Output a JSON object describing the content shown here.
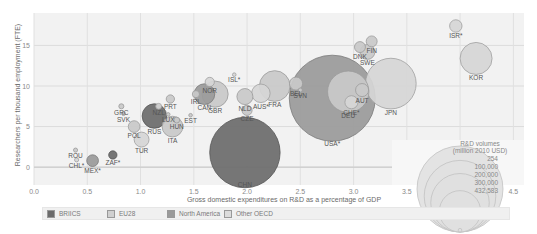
{
  "chart_data": {
    "type": "scatter",
    "subtype": "bubble",
    "title": "",
    "xlabel": "Gross domestic expenditures on  R&D as a percentage of GDP",
    "ylabel": "Researchers per thousand employment (FTE)",
    "xlim": [
      0.0,
      4.6
    ],
    "ylim": [
      -2.2,
      19.0
    ],
    "xticks": [
      "0.0",
      "0.5",
      "1.0",
      "1.5",
      "2.0",
      "2.5",
      "3.0",
      "3.5",
      "4.0",
      "4.5"
    ],
    "yticks": [
      "0",
      "5",
      "10",
      "15"
    ],
    "grid": true,
    "colors": {
      "BRIICS": "#6b6b6b",
      "EU28": "#c9c9c9",
      "North America": "#9a9a9a",
      "Other OECD": "#d6d6d6"
    },
    "legend": [
      "BRIICS",
      "EU28",
      "North America",
      "Other OECD"
    ],
    "size_legend": {
      "title_line1": "R&D volumes",
      "title_line2": "(million 2010 USD)",
      "values": [
        "254",
        "100,000",
        "200,000",
        "300,000",
        "432,583"
      ]
    },
    "points": [
      {
        "label": "ISR*",
        "x": 3.96,
        "y": 17.4,
        "group": "Other OECD",
        "size": 9000
      },
      {
        "label": "KOR",
        "x": 4.15,
        "y": 13.4,
        "group": "Other OECD",
        "size": 60000
      },
      {
        "label": "JPN",
        "x": 3.35,
        "y": 10.3,
        "group": "Other OECD",
        "size": 150000
      },
      {
        "label": "FIN",
        "x": 3.17,
        "y": 15.5,
        "group": "EU28",
        "size": 7000
      },
      {
        "label": "DNK",
        "x": 3.06,
        "y": 14.8,
        "group": "EU28",
        "size": 7000
      },
      {
        "label": "SWE",
        "x": 3.13,
        "y": 14.2,
        "group": "EU28",
        "size": 13000
      },
      {
        "label": "AUT",
        "x": 3.08,
        "y": 9.5,
        "group": "EU28",
        "size": 10000
      },
      {
        "label": "DEU",
        "x": 2.95,
        "y": 9.3,
        "group": "EU28",
        "size": 100000
      },
      {
        "label": "CHE*",
        "x": 2.98,
        "y": 8.0,
        "group": "Other OECD",
        "size": 10000
      },
      {
        "label": "USA*",
        "x": 2.8,
        "y": 8.5,
        "group": "North America",
        "size": 432583
      },
      {
        "label": "BEL",
        "x": 2.46,
        "y": 10.3,
        "group": "EU28",
        "size": 10000
      },
      {
        "label": "SVN",
        "x": 2.5,
        "y": 9.5,
        "group": "EU28",
        "size": 1000
      },
      {
        "label": "FRA",
        "x": 2.26,
        "y": 10.0,
        "group": "EU28",
        "size": 55000
      },
      {
        "label": "AUS*",
        "x": 2.13,
        "y": 9.1,
        "group": "Other OECD",
        "size": 20000
      },
      {
        "label": "NLD",
        "x": 1.98,
        "y": 8.7,
        "group": "EU28",
        "size": 15000
      },
      {
        "label": "CZE",
        "x": 2.0,
        "y": 7.0,
        "group": "EU28",
        "size": 6000
      },
      {
        "label": "ISL*",
        "x": 1.88,
        "y": 11.4,
        "group": "Other OECD",
        "size": 300
      },
      {
        "label": "NOR",
        "x": 1.65,
        "y": 10.5,
        "group": "Other OECD",
        "size": 5000
      },
      {
        "label": "CAN",
        "x": 1.6,
        "y": 9.0,
        "group": "North America",
        "size": 25000
      },
      {
        "label": "GBR",
        "x": 1.7,
        "y": 9.0,
        "group": "EU28",
        "size": 40000
      },
      {
        "label": "IRL",
        "x": 1.52,
        "y": 9.0,
        "group": "EU28",
        "size": 3000
      },
      {
        "label": "EST",
        "x": 1.47,
        "y": 6.4,
        "group": "EU28",
        "size": 500
      },
      {
        "label": "PRT",
        "x": 1.28,
        "y": 8.4,
        "group": "EU28",
        "size": 4000
      },
      {
        "label": "NZL",
        "x": 1.17,
        "y": 7.5,
        "group": "Other OECD",
        "size": 2000
      },
      {
        "label": "LUX",
        "x": 1.26,
        "y": 6.5,
        "group": "EU28",
        "size": 700
      },
      {
        "label": "HUN",
        "x": 1.34,
        "y": 5.8,
        "group": "EU28",
        "size": 2000
      },
      {
        "label": "RUS",
        "x": 1.13,
        "y": 6.3,
        "group": "BRIICS",
        "size": 35000
      },
      {
        "label": "ITA",
        "x": 1.3,
        "y": 5.0,
        "group": "EU28",
        "size": 25000
      },
      {
        "label": "GRC",
        "x": 0.82,
        "y": 7.5,
        "group": "EU28",
        "size": 1500
      },
      {
        "label": "SVK",
        "x": 0.84,
        "y": 6.6,
        "group": "EU28",
        "size": 900
      },
      {
        "label": "POL",
        "x": 0.94,
        "y": 5.0,
        "group": "EU28",
        "size": 8000
      },
      {
        "label": "TUR",
        "x": 1.01,
        "y": 3.4,
        "group": "Other OECD",
        "size": 13000
      },
      {
        "label": "ROU",
        "x": 0.39,
        "y": 2.1,
        "group": "EU28",
        "size": 1000
      },
      {
        "label": "CHL*",
        "x": 0.4,
        "y": 0.9,
        "group": "Other OECD",
        "size": 1000
      },
      {
        "label": "MEX*",
        "x": 0.55,
        "y": 0.8,
        "group": "North America",
        "size": 8000
      },
      {
        "label": "ZAF*",
        "x": 0.74,
        "y": 1.5,
        "group": "BRIICS",
        "size": 4000
      },
      {
        "label": "CHN",
        "x": 1.98,
        "y": 1.8,
        "group": "BRIICS",
        "size": 290000
      }
    ]
  },
  "legend": {
    "items": [
      {
        "label": "BRIICS",
        "color": "#6b6b6b"
      },
      {
        "label": "EU28",
        "color": "#d0d0d0"
      },
      {
        "label": "North America",
        "color": "#9a9a9a"
      },
      {
        "label": "Other OECD",
        "color": "#dcdcdc"
      }
    ]
  }
}
